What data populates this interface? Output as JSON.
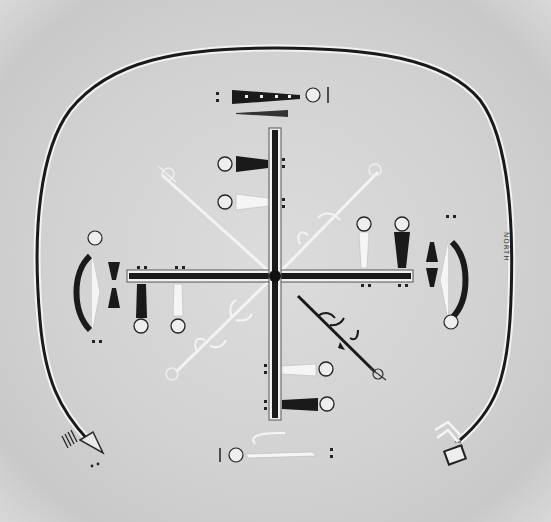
{
  "figure": {
    "kind": "scanned sandpainting illustration",
    "orientation_label": "NORTH",
    "colors": {
      "background": "#d4d4d4",
      "ink_dark": "#1a1a1a",
      "ink_light": "#f4f4f4"
    },
    "elements": {
      "guardian_rainbow": "large rounded enclosing figure, open at bottom",
      "central_cross": "black cross with outlined bars and central dot",
      "plants": [
        "northwest plant (white)",
        "northeast plant (white)",
        "southwest plant (white)",
        "southeast plant (black)"
      ],
      "figure_groups": [
        "top pair of figures",
        "right pair of figures",
        "bottom pair of figures",
        "left pair of figures"
      ],
      "side_figures": [
        "top long figure",
        "right curved figure",
        "bottom long figure",
        "left curved figure"
      ]
    }
  }
}
